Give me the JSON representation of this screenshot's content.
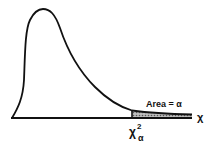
{
  "diagram": {
    "type": "chi-square distribution density curve",
    "shaded_region_label": "Area = α",
    "x_axis_label": "χ",
    "critical_value_label": {
      "base": "χ",
      "superscript": "2",
      "subscript": "α"
    },
    "colors": {
      "curve": "#111111",
      "shade": "#8a8a8a",
      "background": "#ffffff"
    }
  }
}
